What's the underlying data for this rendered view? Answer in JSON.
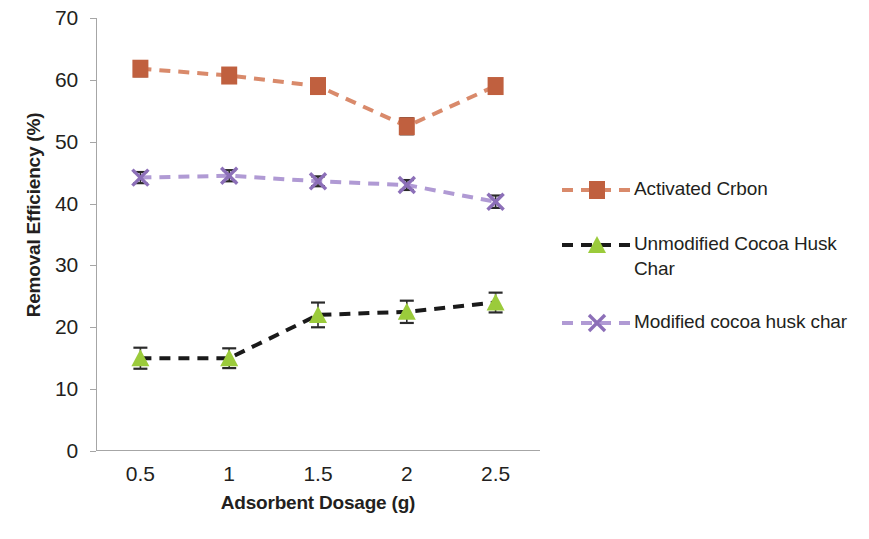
{
  "chart_data": {
    "type": "line",
    "title": "",
    "xlabel": "Adsorbent Dosage (g)",
    "ylabel": "Removal Efficiency (%)",
    "categories": [
      "0.5",
      "1",
      "1.5",
      "2",
      "2.5"
    ],
    "x": [
      0.5,
      1,
      1.5,
      2,
      2.5
    ],
    "ylim": [
      0,
      70
    ],
    "yticks": [
      "0",
      "10",
      "20",
      "30",
      "40",
      "50",
      "60",
      "70"
    ],
    "grid": false,
    "legend_position": "right",
    "series": [
      {
        "name": "Activated Crbon",
        "color": "#C0603F",
        "marker": "square",
        "line_style": "dashed",
        "line_color": "#D98A6B",
        "values": [
          61.8,
          60.7,
          59.0,
          52.5,
          59.0
        ],
        "errors": [
          1.2,
          1.1,
          0.9,
          1.3,
          1.1
        ]
      },
      {
        "name": "Unmodified Cocoa Husk Char",
        "color": "#9BCB3B",
        "marker": "triangle",
        "line_style": "dashed",
        "line_color": "#1a1a1a",
        "values": [
          15.0,
          15.0,
          22.0,
          22.5,
          24.0
        ],
        "errors": [
          1.7,
          1.6,
          2.0,
          1.8,
          1.6
        ]
      },
      {
        "name": "Modified cocoa husk char",
        "color": "#8C6FB8",
        "marker": "x",
        "line_style": "dashed",
        "line_color": "#B09AD4",
        "values": [
          44.2,
          44.5,
          43.6,
          43.0,
          40.3
        ],
        "errors": [
          0.9,
          0.9,
          0.8,
          0.8,
          1.0
        ]
      }
    ]
  },
  "legend": {
    "items": [
      {
        "label": "Activated Crbon"
      },
      {
        "label": "Unmodified Cocoa Husk Char"
      },
      {
        "label": "Modified cocoa husk char"
      }
    ]
  }
}
